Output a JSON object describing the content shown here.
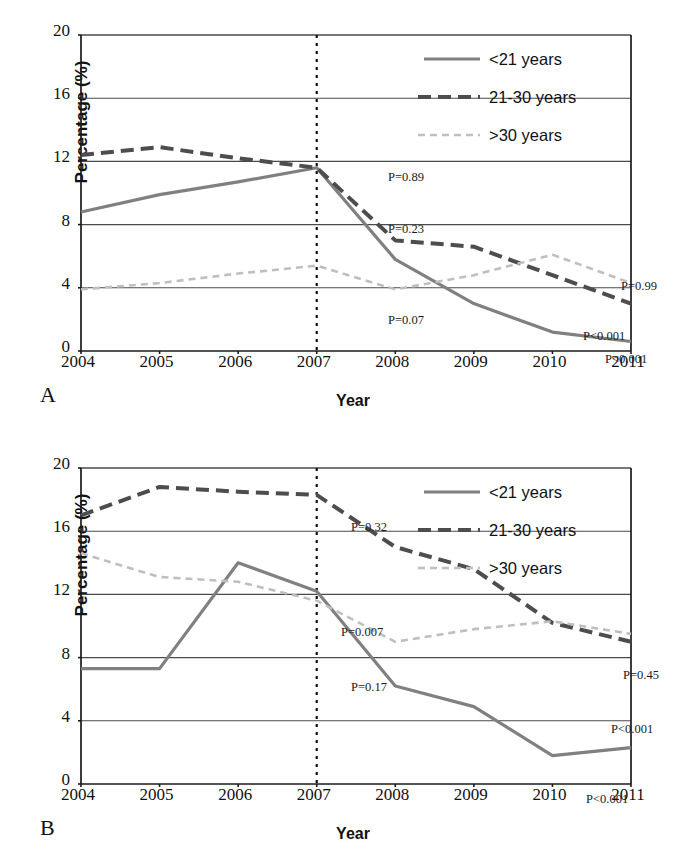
{
  "figure": {
    "panels": [
      {
        "id": "A",
        "label": "A",
        "xlabel": "Year",
        "ylabel": "Percentage (%)",
        "legend": [
          {
            "label": "<21 years",
            "style": "solid",
            "color": "#808080"
          },
          {
            "label": "21-30 years",
            "style": "dashed",
            "color": "#4d4d4d"
          },
          {
            "label": ">30 years",
            "style": "dotted",
            "color": "#bfbfbf"
          }
        ],
        "annotations": [
          {
            "text": "P=0.89",
            "x": 310,
            "y": 138
          },
          {
            "text": "P=0.23",
            "x": 310,
            "y": 190
          },
          {
            "text": "P=0.07",
            "x": 310,
            "y": 281
          },
          {
            "text": "P=0.99",
            "x": 543,
            "y": 247
          },
          {
            "text": "P<0.001",
            "x": 505,
            "y": 297
          },
          {
            "text": "P<0.001",
            "x": 527,
            "y": 320
          }
        ]
      },
      {
        "id": "B",
        "label": "B",
        "xlabel": "Year",
        "ylabel": "Percentage (%)",
        "legend": [
          {
            "label": "<21 years",
            "style": "solid",
            "color": "#808080"
          },
          {
            "label": "21-30 years",
            "style": "dashed",
            "color": "#4d4d4d"
          },
          {
            "label": ">30 years",
            "style": "dotted",
            "color": "#bfbfbf"
          }
        ],
        "annotations": [
          {
            "text": "P=0.32",
            "x": 273,
            "y": 55
          },
          {
            "text": "P=0.007",
            "x": 263,
            "y": 160
          },
          {
            "text": "P=0.17",
            "x": 273,
            "y": 215
          },
          {
            "text": "P=0.45",
            "x": 545,
            "y": 203
          },
          {
            "text": "P<0.001",
            "x": 533,
            "y": 257
          },
          {
            "text": "P<0.001",
            "x": 508,
            "y": 327
          }
        ]
      }
    ]
  },
  "chart_data": [
    {
      "type": "line",
      "panel": "A",
      "title": "",
      "xlabel": "Year",
      "ylabel": "Percentage (%)",
      "x": [
        2004,
        2005,
        2006,
        2007,
        2008,
        2009,
        2010,
        2011
      ],
      "xlim": [
        2004,
        2011
      ],
      "ylim": [
        0,
        20
      ],
      "yticks": [
        0,
        4,
        8,
        12,
        16,
        20
      ],
      "xticks": [
        2004,
        2005,
        2006,
        2007,
        2008,
        2009,
        2010,
        2011
      ],
      "grid": "horizontal",
      "reference_line": {
        "x": 2007,
        "style": "dotted"
      },
      "legend_position": "top-right",
      "series": [
        {
          "name": "<21 years",
          "style": "solid",
          "color": "#808080",
          "p_value": "P=0.23",
          "p_value_late": "P<0.001",
          "values": [
            8.8,
            9.9,
            10.7,
            11.6,
            5.8,
            3.0,
            1.2,
            0.6
          ]
        },
        {
          "name": "21-30 years",
          "style": "dashed",
          "color": "#4d4d4d",
          "p_value": "P=0.89",
          "p_value_late": "P<0.001",
          "values": [
            12.4,
            12.9,
            12.2,
            11.6,
            7.0,
            6.6,
            4.8,
            3.0
          ]
        },
        {
          "name": ">30 years",
          "style": "dotted",
          "color": "#bfbfbf",
          "p_value": "P=0.07",
          "p_value_late": "P=0.99",
          "values": [
            3.9,
            4.3,
            4.9,
            5.4,
            3.9,
            4.8,
            6.1,
            4.3
          ]
        }
      ]
    },
    {
      "type": "line",
      "panel": "B",
      "title": "",
      "xlabel": "Year",
      "ylabel": "Percentage (%)",
      "x": [
        2004,
        2005,
        2006,
        2007,
        2008,
        2009,
        2010,
        2011
      ],
      "xlim": [
        2004,
        2011
      ],
      "ylim": [
        0,
        20
      ],
      "yticks": [
        0,
        4,
        8,
        12,
        16,
        20
      ],
      "xticks": [
        2004,
        2005,
        2006,
        2007,
        2008,
        2009,
        2010,
        2011
      ],
      "grid": "horizontal",
      "reference_line": {
        "x": 2007,
        "style": "dotted"
      },
      "legend_position": "top-right",
      "series": [
        {
          "name": "<21 years",
          "style": "solid",
          "color": "#808080",
          "p_value": "P=0.007",
          "p_value_late": "P<0.001",
          "values": [
            7.3,
            7.3,
            14.0,
            12.2,
            6.2,
            4.9,
            1.8,
            2.3
          ]
        },
        {
          "name": "21-30 years",
          "style": "dashed",
          "color": "#4d4d4d",
          "p_value": "P=0.32",
          "p_value_late": "P=0.45",
          "values": [
            17.0,
            18.8,
            18.5,
            18.3,
            15.0,
            13.6,
            10.2,
            9.0
          ]
        },
        {
          "name": ">30 years",
          "style": "dotted",
          "color": "#bfbfbf",
          "p_value": "P=0.17",
          "p_value_late": "P<0.001",
          "values": [
            14.6,
            13.1,
            12.8,
            11.6,
            9.0,
            9.8,
            10.3,
            9.5
          ]
        }
      ]
    }
  ]
}
